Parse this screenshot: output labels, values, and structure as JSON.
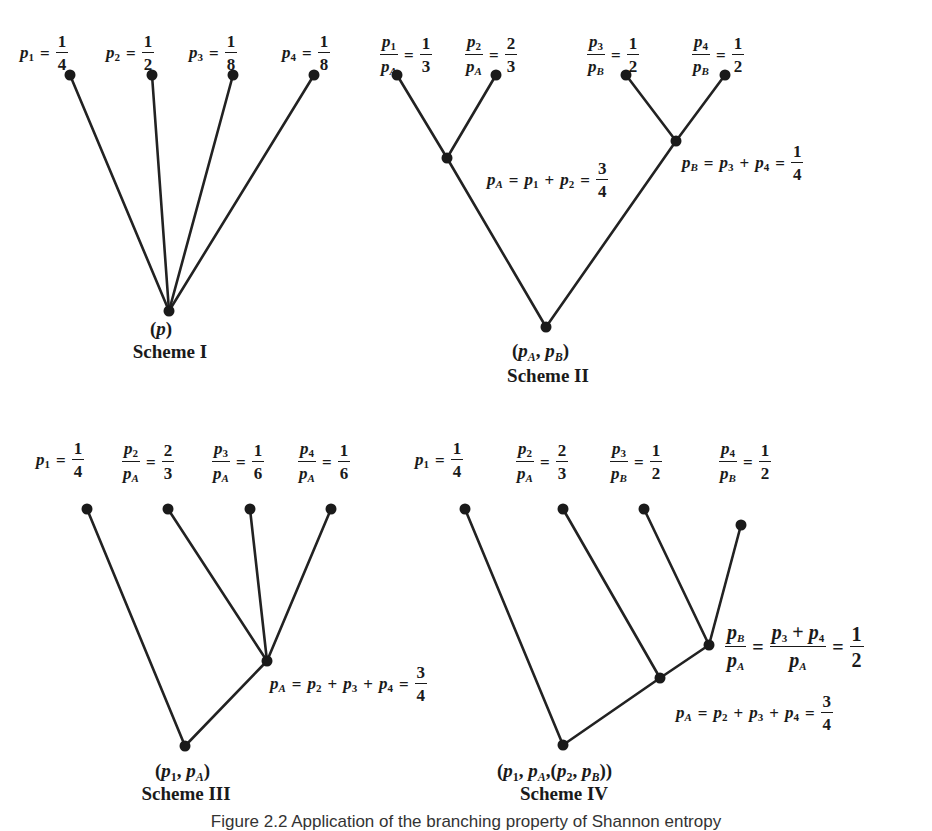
{
  "figure": {
    "caption": "Figure 2.2  Application of the branching property of Shannon entropy",
    "ink_color": "#1a1a1a",
    "background": "#ffffff"
  },
  "schemes": [
    {
      "title": "Scheme I",
      "root_label": "(p)",
      "leaf_labels": [
        {
          "lhs": "p1",
          "num": "1",
          "den": "4"
        },
        {
          "lhs": "p2",
          "num": "1",
          "den": "2"
        },
        {
          "lhs": "p3",
          "num": "1",
          "den": "8"
        },
        {
          "lhs": "p4",
          "num": "1",
          "den": "8"
        }
      ]
    },
    {
      "title": "Scheme II",
      "root_label": "(pA, pB)",
      "leaf_labels": [
        {
          "lhs": "p1/pA",
          "num": "1",
          "den": "3"
        },
        {
          "lhs": "p2/pA",
          "num": "2",
          "den": "3"
        },
        {
          "lhs": "p3/pB",
          "num": "1",
          "den": "2"
        },
        {
          "lhs": "p4/pB",
          "num": "1",
          "den": "2"
        }
      ],
      "internal_labels": [
        {
          "text": "pA = p1 + p2 = 3/4",
          "num": "3",
          "den": "4"
        },
        {
          "text": "pB = p3 + p4 = 1/4",
          "num": "1",
          "den": "4"
        }
      ]
    },
    {
      "title": "Scheme III",
      "root_label": "(p1, pA)",
      "leaf_labels": [
        {
          "lhs": "p1",
          "num": "1",
          "den": "4"
        },
        {
          "lhs": "p2/pA",
          "num": "2",
          "den": "3"
        },
        {
          "lhs": "p3/pA",
          "num": "1",
          "den": "6"
        },
        {
          "lhs": "p4/pA",
          "num": "1",
          "den": "6"
        }
      ],
      "internal_labels": [
        {
          "text": "pA = p2 + p3 + p4 = 3/4",
          "num": "3",
          "den": "4"
        }
      ]
    },
    {
      "title": "Scheme IV",
      "root_label": "(p1, pA, (p2, pB))",
      "leaf_labels": [
        {
          "lhs": "p1",
          "num": "1",
          "den": "4"
        },
        {
          "lhs": "p2/pA",
          "num": "2",
          "den": "3"
        },
        {
          "lhs": "p3/pB",
          "num": "1",
          "den": "2"
        },
        {
          "lhs": "p4/pB",
          "num": "1",
          "den": "2"
        }
      ],
      "internal_labels": [
        {
          "text": "pB/pA = (p3 + p4)/pA = 1/2",
          "num": "1",
          "den": "2"
        },
        {
          "text": "pA = p2 + p3 + p4 = 3/4",
          "num": "3",
          "den": "4"
        }
      ]
    }
  ],
  "symbols": {
    "p": "p",
    "eq": "=",
    "plus": "+",
    "comma": ",",
    "lparen": "(",
    "rparen": ")",
    "s1": "1",
    "s2": "2",
    "s3": "3",
    "s4": "4",
    "sA": "A",
    "sB": "B"
  }
}
